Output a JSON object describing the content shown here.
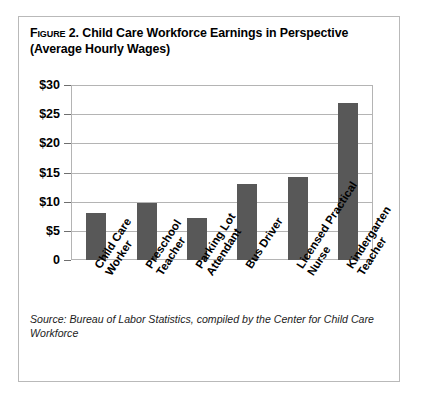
{
  "figure": {
    "label": "Figure 2.",
    "title": "Child Care Workforce Earnings in Perspective (Average Hourly Wages)",
    "source": "Source: Bureau of Labor Statistics, compiled by the Center for Child Care Workforce"
  },
  "chart_data": {
    "type": "bar",
    "title": "Child Care Workforce Earnings in Perspective (Average Hourly Wages)",
    "xlabel": "",
    "ylabel": "",
    "ylim": [
      0,
      30
    ],
    "yticks": [
      0,
      5,
      10,
      15,
      20,
      25,
      30
    ],
    "ytick_labels": [
      "0",
      "$5",
      "$10",
      "$15",
      "$20",
      "$25",
      "$30"
    ],
    "grid": true,
    "legend": false,
    "bar_color": "#585858",
    "categories": [
      "Child Care Worker",
      "Preschool Teacher",
      "Parking Lot Attendant",
      "Bus Driver",
      "Licensed Practical Nurse",
      "Kindergarten Teacher"
    ],
    "category_lines": [
      [
        "Child Care",
        "Worker"
      ],
      [
        "Preschool",
        "Teacher"
      ],
      [
        "Parking Lot",
        "Attendant"
      ],
      [
        "Bus Driver"
      ],
      [
        "Licensed Practical",
        "Nurse"
      ],
      [
        "Kindergarten",
        "Teacher"
      ]
    ],
    "values": [
      8.0,
      9.7,
      7.2,
      13.0,
      14.2,
      27.0
    ],
    "source": "Source: Bureau of Labor Statistics, compiled by the Center for Child Care Workforce"
  }
}
